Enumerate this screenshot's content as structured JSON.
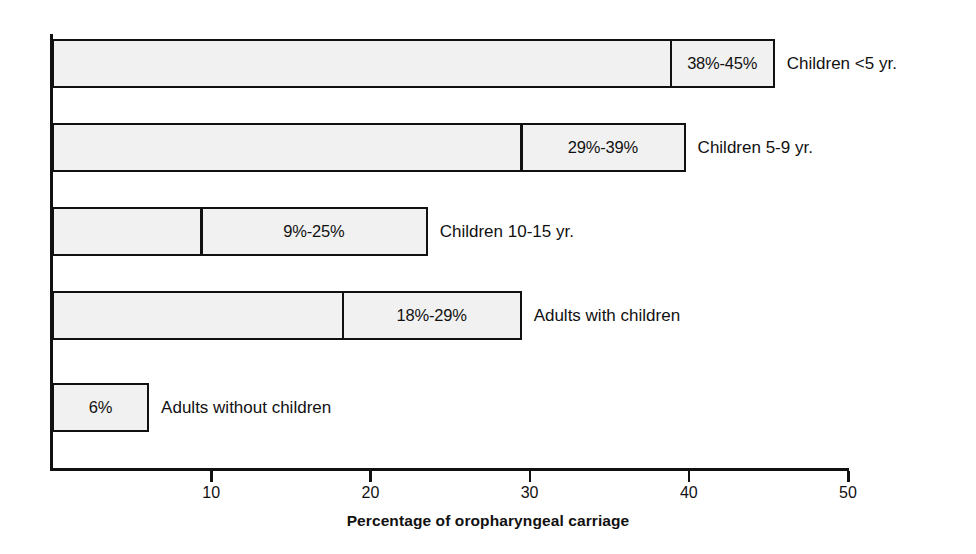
{
  "chart_data": {
    "type": "bar",
    "orientation": "horizontal",
    "title": "",
    "xlabel": "Percentage of oropharyngeal carriage",
    "ylabel": "",
    "xlim": [
      0,
      50
    ],
    "xticks": [
      0,
      10,
      20,
      30,
      40,
      50
    ],
    "xtick_labels": [
      "",
      "10",
      "20",
      "30",
      "40",
      "50"
    ],
    "grid": false,
    "legend": "none",
    "value_unit": "percent",
    "categories": [
      "Children <5 yr.",
      "Children 5-9 yr.",
      "Children 10-15 yr.",
      "Adults with children",
      "Adults without children"
    ],
    "bars": [
      {
        "category": "Children <5 yr.",
        "range_label": "38%-45%",
        "low": 38,
        "high": 45,
        "bar_end": 45.4,
        "divider_at": 38.8,
        "has_divider": true
      },
      {
        "category": "Children 5-9 yr.",
        "range_label": "29%-39%",
        "low": 29,
        "high": 39,
        "bar_end": 39.8,
        "divider_at": 29.4,
        "has_divider": true
      },
      {
        "category": "Children 10-15 yr.",
        "range_label": "9%-25%",
        "low": 9,
        "high": 25,
        "bar_end": 23.6,
        "divider_at": 9.3,
        "has_divider": true
      },
      {
        "category": "Adults with children",
        "range_label": "18%-29%",
        "low": 18,
        "high": 29,
        "bar_end": 29.5,
        "divider_at": 18.2,
        "has_divider": true
      },
      {
        "category": "Adults without children",
        "range_label": "6%",
        "low": 6,
        "high": 6,
        "bar_end": 6.1,
        "divider_at": null,
        "has_divider": false
      }
    ],
    "colors": {
      "bar_fill": "#f1f1f1",
      "bar_stroke": "#111111",
      "axis": "#111111",
      "text": "#111111",
      "background": "#ffffff"
    }
  },
  "geometry": {
    "x_origin_px": 52,
    "px_per_unit": 15.92,
    "bar_tops_px": [
      39,
      123,
      207,
      291,
      383
    ],
    "bar_height_px": 49
  }
}
